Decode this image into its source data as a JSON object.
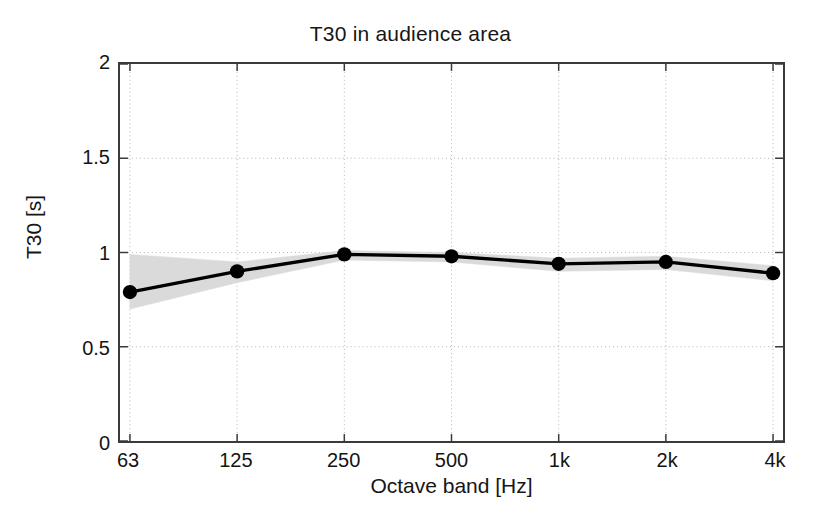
{
  "chart_data": {
    "type": "line",
    "title": "T30 in audience area",
    "xlabel": "Octave band [Hz]",
    "ylabel": "T30 [s]",
    "categories": [
      "63",
      "125",
      "250",
      "500",
      "1k",
      "2k",
      "4k"
    ],
    "x_tick_labels": [
      "63",
      "125",
      "250",
      "500",
      "1k",
      "2k",
      "4k"
    ],
    "y_tick_labels": [
      "0",
      "0.5",
      "1",
      "1.5",
      "2"
    ],
    "y_tick_values": [
      0,
      0.5,
      1,
      1.5,
      2
    ],
    "ylim": [
      0,
      2
    ],
    "xlim": [
      0,
      6
    ],
    "grid": true,
    "grid_style": "dotted",
    "legend": "none",
    "series": [
      {
        "name": "T30 mean",
        "style": "line-with-markers",
        "color": "#000000",
        "marker": "filled-circle",
        "values": [
          0.79,
          0.9,
          0.99,
          0.98,
          0.94,
          0.95,
          0.89
        ]
      }
    ],
    "band": {
      "name": "spatial standard deviation",
      "color": "#d9d9d9",
      "upper": [
        0.99,
        0.95,
        1.01,
        1.0,
        0.97,
        0.98,
        0.93
      ],
      "lower": [
        0.7,
        0.84,
        0.96,
        0.95,
        0.9,
        0.91,
        0.85
      ]
    },
    "colors": {
      "line": "#000000",
      "marker": "#000000",
      "band": "#d9d9d9",
      "grid": "#b4b4b4",
      "axis": "#3a3a3a",
      "background": "#ffffff"
    }
  }
}
